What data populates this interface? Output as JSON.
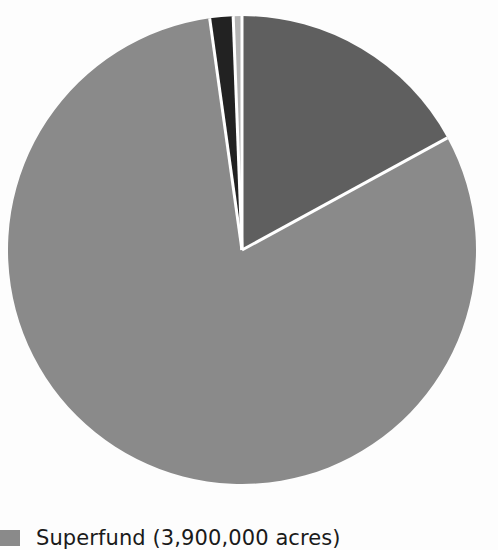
{
  "chart_data": {
    "type": "pie",
    "title": "",
    "center": [
      242,
      250
    ],
    "radius": 234,
    "start_angle_deg": 0,
    "direction": "clockwise",
    "separator_color": "#ffffff",
    "slices": [
      {
        "name": "Category A (dark gray)",
        "value": 17.0,
        "color": "#5f5f5f"
      },
      {
        "name": "Superfund (3,900,000 acres)",
        "value": 80.5,
        "color": "#8a8a8a"
      },
      {
        "name": "Category C (black)",
        "value": 1.6,
        "color": "#222222"
      },
      {
        "name": "Category D (light gray)",
        "value": 0.6,
        "color": "#b3b3b3"
      }
    ],
    "legend": [
      {
        "label": "Superfund (3,900,000 acres)",
        "color": "#8a8a8a"
      }
    ],
    "legend_position": "bottom-left"
  }
}
